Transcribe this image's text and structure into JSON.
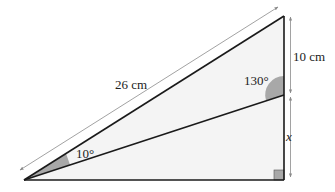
{
  "diagram": {
    "type": "geometry-triangle",
    "labels": {
      "hypotenuse": "26 cm",
      "upper_segment": "10 cm",
      "lower_segment": "x",
      "angle_top": "130°",
      "angle_left": "10°"
    },
    "colors": {
      "fill": "#f4f4f4",
      "stroke": "#1a1a1a",
      "angle_shade": "#a8a8a8",
      "dimension_line": "#8a8a8a"
    }
  }
}
